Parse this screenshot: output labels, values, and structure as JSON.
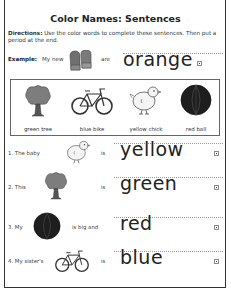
{
  "worksheet": {
    "title": "Color Names: Sentences",
    "directions_label": "Directions:",
    "directions_text": " Use the color words to complete these sentences. Then put a period at the end.",
    "example": {
      "label": "Example:",
      "lead": "My new",
      "picture": "mittens-icon",
      "verb": "are",
      "answer": "orange"
    },
    "word_bank": [
      {
        "caption": "green tree",
        "picture": "tree-icon"
      },
      {
        "caption": "blue bike",
        "picture": "bike-icon"
      },
      {
        "caption": "yellow chick",
        "picture": "chick-icon"
      },
      {
        "caption": "red ball",
        "picture": "ball-icon"
      }
    ],
    "sentences": [
      {
        "lead": "1. The baby",
        "picture": "chick-icon",
        "verb": "is",
        "answer": "yellow"
      },
      {
        "lead": "2. This",
        "picture": "tree-icon",
        "verb": "is",
        "answer": "green"
      },
      {
        "lead": "3. My",
        "picture": "ball-icon",
        "verb": "is big and",
        "answer": "red"
      },
      {
        "lead": "4. My sister's",
        "picture": "bike-icon",
        "verb": "is",
        "answer": "blue"
      }
    ]
  }
}
